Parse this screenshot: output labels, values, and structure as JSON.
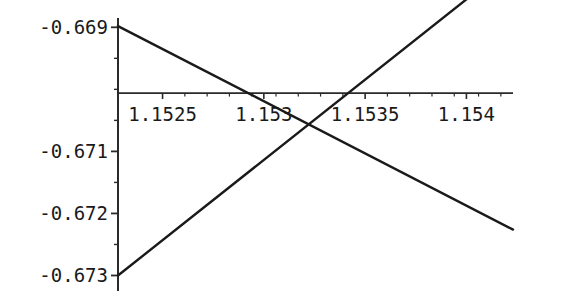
{
  "chart_data": {
    "type": "line",
    "title": "",
    "subtitle": "",
    "xlabel": "",
    "ylabel": "",
    "grid": false,
    "legend": "none",
    "axis_style": "crossing-axes",
    "xlim": [
      1.15228,
      1.15423
    ],
    "ylim": [
      -0.67325,
      -0.66885
    ],
    "x_ticks": [
      {
        "value": 1.1525,
        "label": "1.1525"
      },
      {
        "value": 1.153,
        "label": "1.153"
      },
      {
        "value": 1.1535,
        "label": "1.1535"
      },
      {
        "value": 1.154,
        "label": "1.154"
      }
    ],
    "y_ticks": [
      {
        "value": -0.669,
        "label": "-0.669"
      },
      {
        "value": -0.671,
        "label": "-0.671"
      },
      {
        "value": -0.672,
        "label": "-0.672"
      },
      {
        "value": -0.673,
        "label": "-0.673"
      }
    ],
    "x_minor_ticks": [
      1.15261,
      1.15272,
      1.15283,
      1.15294,
      1.15306,
      1.15317,
      1.15328,
      1.15339,
      1.15361,
      1.15372,
      1.15383,
      1.15394,
      1.15406,
      1.15417
    ],
    "y_minor_ticks": [
      -0.6695,
      -0.67,
      -0.6705,
      -0.6715,
      -0.6725
    ],
    "x_axis_at_y": -0.67006,
    "y_axis_at_x": 1.15228,
    "series": [
      {
        "name": "descending-line",
        "color": "#1a1a1a",
        "points": [
          {
            "x": 1.15228,
            "y": -0.66898
          },
          {
            "x": 1.15423,
            "y": -0.67226
          }
        ]
      },
      {
        "name": "ascending-line",
        "color": "#1a1a1a",
        "points": [
          {
            "x": 1.15228,
            "y": -0.673
          },
          {
            "x": 1.15422,
            "y": -0.66798
          }
        ]
      }
    ],
    "intersection": {
      "x": 1.15325,
      "y": -0.67084
    }
  },
  "colors": {
    "background": "#ffffff",
    "axis": "#2a2a2a",
    "line": "#1a1a1a",
    "text": "#1a1a1a"
  }
}
